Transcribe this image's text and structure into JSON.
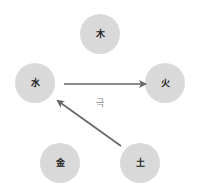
{
  "diagram": {
    "colors": {
      "node_fill": "#d9d9d9",
      "arrow": "#666666",
      "node_text": "#222222",
      "edge_label": "#8a8a8a",
      "background": "#ffffff"
    },
    "nodes": [
      {
        "id": "wood",
        "label": "木",
        "cx": 100,
        "cy": 34,
        "r": 20
      },
      {
        "id": "water",
        "label": "水",
        "cx": 35,
        "cy": 83,
        "r": 20
      },
      {
        "id": "fire",
        "label": "火",
        "cx": 165,
        "cy": 83,
        "r": 20
      },
      {
        "id": "metal",
        "label": "金",
        "cx": 60,
        "cy": 163,
        "r": 20
      },
      {
        "id": "earth",
        "label": "土",
        "cx": 140,
        "cy": 163,
        "r": 20
      }
    ],
    "edges": [
      {
        "id": "water-to-fire",
        "from": "water",
        "to": "fire",
        "x1": 64,
        "y1": 84,
        "x2": 145,
        "y2": 84
      },
      {
        "id": "earth-to-water",
        "from": "earth",
        "to": "water",
        "x1": 121,
        "y1": 146,
        "x2": 58,
        "y2": 101
      }
    ],
    "edge_label": {
      "text": "극",
      "x": 100,
      "y": 106
    }
  }
}
